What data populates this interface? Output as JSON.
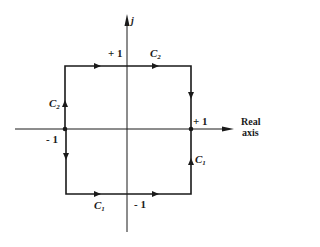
{
  "diagram": {
    "type": "contour-in-complex-plane",
    "axes": {
      "vertical_label": "j",
      "horizontal_label_line1": "Real",
      "horizontal_label_line2": "axis"
    },
    "tick_labels": {
      "top": "+ 1",
      "bottom": "- 1",
      "right": "+ 1",
      "left": "- 1"
    },
    "contour_labels": {
      "top_right": {
        "base": "C",
        "sub": "2"
      },
      "left_upper": {
        "base": "C",
        "sub": "2"
      },
      "right_lower": {
        "base": "C",
        "sub": "1"
      },
      "bottom_left": {
        "base": "C",
        "sub": "1"
      }
    },
    "colors": {
      "stroke": "#1a1a1a",
      "background": "#ffffff"
    }
  }
}
